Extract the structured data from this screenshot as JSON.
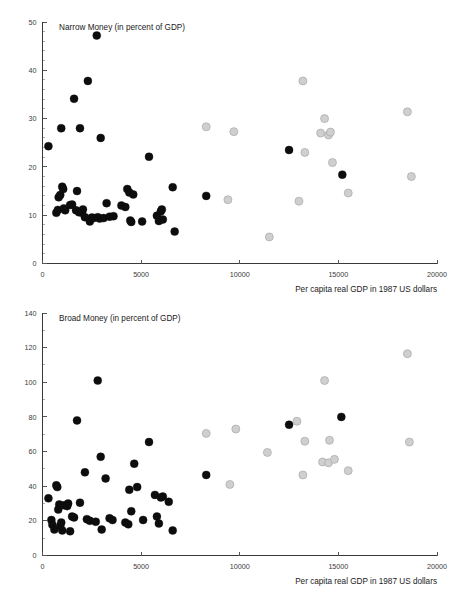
{
  "figure": {
    "background_color": "#ffffff",
    "dark_marker_color": "#0d0d0d",
    "light_marker_color": "#cfcfcf",
    "light_marker_edge_color": "#a8a8a8"
  },
  "panels": [
    {
      "id": "narrow-money",
      "series_label": "Narrow Money (in percent of GDP)",
      "xlabel": "Per capita real GDP in 1987 US dollars"
    },
    {
      "id": "broad-money",
      "series_label": "Broad Money (in percent of GDP)",
      "xlabel": "Per capita real GDP in 1987 US dollars"
    }
  ],
  "chart_data": [
    {
      "type": "scatter",
      "title": "Narrow Money (in percent of GDP)",
      "xlabel": "Per capita real GDP in 1987 US dollars",
      "ylabel": "",
      "xlim": [
        0,
        20000
      ],
      "ylim": [
        0,
        50
      ],
      "xticks": [
        0,
        5000,
        10000,
        15000,
        20000
      ],
      "xtick_labels": [
        "0",
        "5000",
        "10000",
        "15000",
        "20000"
      ],
      "yticks": [
        0,
        10,
        20,
        30,
        40,
        50
      ],
      "ytick_labels": [
        "0",
        "10",
        "20",
        "30",
        "40",
        "50"
      ],
      "yminor_step": 2,
      "grid": false,
      "legend": "none",
      "series": [
        {
          "name": "dark",
          "marker": "filled-circle",
          "color": "#0d0d0d",
          "points": [
            [
              300,
              24.3
            ],
            [
              700,
              10.5
            ],
            [
              780,
              11.1
            ],
            [
              820,
              13.7
            ],
            [
              900,
              14.2
            ],
            [
              950,
              28.0
            ],
            [
              1000,
              15.9
            ],
            [
              1050,
              15.4
            ],
            [
              1080,
              11.4
            ],
            [
              1150,
              11.0
            ],
            [
              1400,
              12.1
            ],
            [
              1500,
              12.2
            ],
            [
              1600,
              34.1
            ],
            [
              1700,
              11.0
            ],
            [
              1750,
              15.0
            ],
            [
              1850,
              10.6
            ],
            [
              1900,
              28.0
            ],
            [
              2000,
              10.5
            ],
            [
              2050,
              11.2
            ],
            [
              2150,
              9.6
            ],
            [
              2300,
              37.8
            ],
            [
              2400,
              8.7
            ],
            [
              2500,
              9.5
            ],
            [
              2600,
              9.4
            ],
            [
              2750,
              47.2
            ],
            [
              2800,
              9.6
            ],
            [
              2900,
              9.3
            ],
            [
              2950,
              26.0
            ],
            [
              3100,
              9.4
            ],
            [
              3250,
              12.5
            ],
            [
              3400,
              9.7
            ],
            [
              3600,
              9.8
            ],
            [
              4000,
              12.0
            ],
            [
              4200,
              11.7
            ],
            [
              4300,
              15.4
            ],
            [
              4400,
              14.7
            ],
            [
              4450,
              8.9
            ],
            [
              4500,
              8.6
            ],
            [
              4600,
              14.3
            ],
            [
              5050,
              8.7
            ],
            [
              5400,
              22.1
            ],
            [
              5800,
              9.9
            ],
            [
              5900,
              8.8
            ],
            [
              6000,
              10.8
            ],
            [
              6050,
              11.2
            ],
            [
              6100,
              9.1
            ],
            [
              6600,
              15.8
            ],
            [
              6700,
              6.6
            ],
            [
              8300,
              14.0
            ],
            [
              12500,
              23.5
            ],
            [
              15200,
              18.4
            ]
          ]
        },
        {
          "name": "light",
          "marker": "filled-circle",
          "color": "#cfcfcf",
          "points": [
            [
              8300,
              28.3
            ],
            [
              9400,
              13.2
            ],
            [
              9700,
              27.3
            ],
            [
              11500,
              5.5
            ],
            [
              13000,
              12.9
            ],
            [
              13200,
              37.8
            ],
            [
              13300,
              23.0
            ],
            [
              14100,
              27.0
            ],
            [
              14300,
              30.0
            ],
            [
              14500,
              26.6
            ],
            [
              14600,
              27.2
            ],
            [
              14700,
              20.9
            ],
            [
              15500,
              14.6
            ],
            [
              18500,
              31.4
            ],
            [
              18700,
              18.0
            ]
          ]
        }
      ]
    },
    {
      "type": "scatter",
      "title": "Broad Money (in percent of GDP)",
      "xlabel": "Per capita real GDP in 1987 US dollars",
      "ylabel": "",
      "xlim": [
        0,
        20000
      ],
      "ylim": [
        0,
        140
      ],
      "xticks": [
        0,
        5000,
        10000,
        15000,
        20000
      ],
      "xtick_labels": [
        "0",
        "5000",
        "10000",
        "15000",
        "20000"
      ],
      "yticks": [
        0,
        20,
        40,
        60,
        80,
        100,
        120,
        140
      ],
      "ytick_labels": [
        "0",
        "20",
        "40",
        "60",
        "80",
        "100",
        "120",
        "140"
      ],
      "yminor_step": 10,
      "grid": false,
      "legend": "none",
      "series": [
        {
          "name": "dark",
          "marker": "filled-circle",
          "color": "#0d0d0d",
          "points": [
            [
              300,
              33.0
            ],
            [
              450,
              20.5
            ],
            [
              500,
              17.8
            ],
            [
              600,
              15.0
            ],
            [
              700,
              40.5
            ],
            [
              750,
              39.5
            ],
            [
              800,
              26.5
            ],
            [
              850,
              29.5
            ],
            [
              900,
              17.0
            ],
            [
              950,
              19.0
            ],
            [
              1000,
              14.5
            ],
            [
              1100,
              29.0
            ],
            [
              1250,
              28.5
            ],
            [
              1300,
              30.0
            ],
            [
              1400,
              14.0
            ],
            [
              1500,
              22.5
            ],
            [
              1600,
              22.0
            ],
            [
              1750,
              78.0
            ],
            [
              1900,
              30.5
            ],
            [
              2150,
              48.0
            ],
            [
              2250,
              21.0
            ],
            [
              2400,
              20.0
            ],
            [
              2700,
              19.5
            ],
            [
              2800,
              101.0
            ],
            [
              2950,
              57.0
            ],
            [
              3000,
              15.0
            ],
            [
              3200,
              44.5
            ],
            [
              3400,
              21.5
            ],
            [
              3550,
              20.5
            ],
            [
              4200,
              19.0
            ],
            [
              4350,
              18.0
            ],
            [
              4400,
              38.0
            ],
            [
              4500,
              25.5
            ],
            [
              4650,
              53.0
            ],
            [
              4800,
              39.5
            ],
            [
              5100,
              20.5
            ],
            [
              5400,
              65.5
            ],
            [
              5700,
              35.0
            ],
            [
              5800,
              22.5
            ],
            [
              5900,
              18.5
            ],
            [
              6000,
              33.5
            ],
            [
              6100,
              34.0
            ],
            [
              6400,
              31.0
            ],
            [
              6600,
              14.5
            ],
            [
              8300,
              46.5
            ],
            [
              12500,
              75.5
            ],
            [
              15150,
              80.0
            ]
          ]
        },
        {
          "name": "light",
          "marker": "filled-circle",
          "color": "#cfcfcf",
          "points": [
            [
              8300,
              70.5
            ],
            [
              9500,
              41.0
            ],
            [
              9800,
              73.0
            ],
            [
              11400,
              59.5
            ],
            [
              12900,
              77.5
            ],
            [
              13200,
              46.5
            ],
            [
              13300,
              66.0
            ],
            [
              14200,
              54.0
            ],
            [
              14300,
              101.0
            ],
            [
              14500,
              53.5
            ],
            [
              14550,
              66.5
            ],
            [
              14800,
              55.5
            ],
            [
              15500,
              49.0
            ],
            [
              18500,
              116.5
            ],
            [
              18600,
              65.5
            ]
          ]
        }
      ]
    }
  ]
}
